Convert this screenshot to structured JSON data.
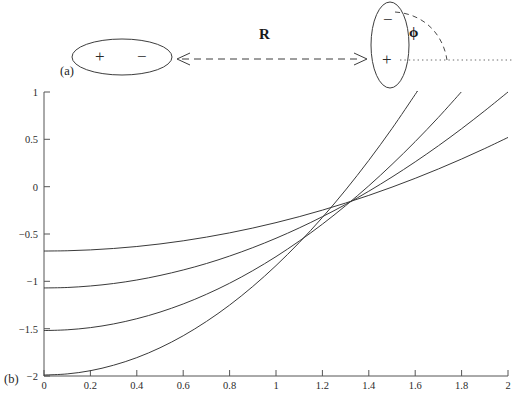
{
  "figure": {
    "panels": [
      {
        "id": "a",
        "label": "(a)"
      },
      {
        "id": "b",
        "label": "(b)"
      }
    ]
  },
  "panel_a": {
    "label": "(a)",
    "left_dipole": {
      "orientation": "horizontal",
      "positive_sign": "+",
      "negative_sign": "−"
    },
    "right_dipole": {
      "orientation": "vertical",
      "positive_sign": "+",
      "negative_sign": "−"
    },
    "separation_label": "R",
    "angle_label": "ϕ",
    "arrow_style": "dashed-double-headed",
    "reference_line_style": "dotted",
    "arc_style": "dashed"
  },
  "panel_b": {
    "label": "(b)"
  },
  "chart_data": {
    "type": "line",
    "title": "",
    "xlabel": "",
    "ylabel": "",
    "xlim": [
      0,
      2
    ],
    "ylim": [
      -2,
      1
    ],
    "xticks": [
      0,
      0.2,
      0.4,
      0.6,
      0.8,
      1,
      1.2,
      1.4,
      1.6,
      1.8,
      2
    ],
    "xticklabels": [
      "0",
      "0.2",
      "0.4",
      "0.6",
      "0.8",
      "1",
      "1.2",
      "1.4",
      "1.6",
      "1.8",
      "2"
    ],
    "yticks": [
      1,
      0.5,
      0,
      -0.5,
      -1,
      -1.5,
      -2
    ],
    "yticklabels": [
      "1",
      "0.5",
      "0",
      "−0.5",
      "−1",
      "−1.5",
      "−2"
    ],
    "grid": false,
    "legend": null,
    "line_color": "#3a3a3a",
    "x": [
      0,
      0.1,
      0.2,
      0.3,
      0.4,
      0.5,
      0.6,
      0.7,
      0.8,
      0.9,
      1.0,
      1.1,
      1.2,
      1.3,
      1.4,
      1.5,
      1.6,
      1.7,
      1.8,
      1.9,
      2.0
    ],
    "series": [
      {
        "name": "curve-1",
        "values": [
          -0.68,
          -0.677,
          -0.668,
          -0.653,
          -0.632,
          -0.605,
          -0.572,
          -0.533,
          -0.488,
          -0.437,
          -0.38,
          -0.317,
          -0.248,
          -0.173,
          -0.092,
          -0.005,
          0.088,
          0.187,
          0.292,
          0.403,
          0.52
        ]
      },
      {
        "name": "curve-2",
        "values": [
          -1.07,
          -1.065,
          -1.049,
          -1.023,
          -0.986,
          -0.938,
          -0.88,
          -0.812,
          -0.733,
          -0.644,
          -0.545,
          -0.436,
          -0.317,
          -0.188,
          -0.048,
          0.102,
          0.262,
          0.432,
          0.612,
          0.802,
          1.0
        ]
      },
      {
        "name": "curve-3",
        "values": [
          -1.52,
          -1.512,
          -1.489,
          -1.45,
          -1.395,
          -1.325,
          -1.239,
          -1.137,
          -1.02,
          -0.887,
          -0.739,
          -0.575,
          -0.396,
          -0.201,
          0.009,
          0.235,
          0.476,
          0.732,
          1.004,
          1.291,
          1.594
        ]
      },
      {
        "name": "curve-4",
        "values": [
          -1.99,
          -1.978,
          -1.944,
          -1.886,
          -1.806,
          -1.702,
          -1.575,
          -1.424,
          -1.251,
          -1.054,
          -0.834,
          -0.591,
          -0.325,
          -0.035,
          0.278,
          0.614,
          0.974,
          1.356,
          1.762,
          2.19,
          2.642
        ]
      }
    ],
    "visible_curve_endpoints_at_x2": [
      0.83,
      0.63,
      0.35,
      0.13
    ],
    "visible_curve_starts_at_x0": [
      -0.68,
      -1.07,
      -1.52,
      -1.99
    ],
    "crossing_region": {
      "x": 1.35,
      "y": -0.42
    }
  }
}
